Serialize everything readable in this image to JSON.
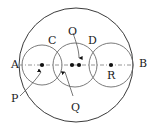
{
  "figure": {
    "type": "geometry-diagram",
    "background_color": "#ffffff",
    "stroke_color": "#3b3b3b",
    "dot_color": "#111111",
    "axis_line_style": "dash-dot",
    "labels": [
      {
        "id": "A",
        "text": "A",
        "x": 11,
        "y": 59,
        "role": "endpoint-left"
      },
      {
        "id": "B",
        "text": "B",
        "x": 139,
        "y": 58,
        "role": "endpoint-right"
      },
      {
        "id": "C",
        "text": "C",
        "x": 48,
        "y": 35,
        "role": "point-top-left"
      },
      {
        "id": "O",
        "text": "O",
        "x": 68,
        "y": 26,
        "role": "center-big-circle"
      },
      {
        "id": "D",
        "text": "D",
        "x": 88,
        "y": 35,
        "role": "point-top-right"
      },
      {
        "id": "P",
        "text": "P",
        "x": 11,
        "y": 93,
        "role": "center-left-circle"
      },
      {
        "id": "Q",
        "text": "Q",
        "x": 71,
        "y": 102,
        "role": "center-middle-circle"
      },
      {
        "id": "R",
        "text": "R",
        "x": 107,
        "y": 70,
        "role": "center-right-circle"
      }
    ],
    "circles": [
      {
        "id": "big-circle",
        "cx": 76,
        "cy": 65,
        "r": 57,
        "name": "outer-circle"
      },
      {
        "id": "left-circle",
        "cx": 42,
        "cy": 65,
        "r": 20,
        "name": "circle-p"
      },
      {
        "id": "middle-circle",
        "cx": 75,
        "cy": 65,
        "r": 22,
        "name": "circle-q"
      },
      {
        "id": "right-circle",
        "cx": 111,
        "cy": 65,
        "r": 22,
        "name": "circle-r"
      }
    ],
    "dots": [
      {
        "id": "dot-p",
        "cx": 42,
        "cy": 65,
        "r": 2.1,
        "name": "center-dot-p"
      },
      {
        "id": "dot-q",
        "cx": 72,
        "cy": 65,
        "r": 2.1,
        "name": "center-dot-q"
      },
      {
        "id": "dot-o",
        "cx": 79,
        "cy": 65,
        "r": 2.1,
        "name": "center-dot-o"
      },
      {
        "id": "dot-r",
        "cx": 111,
        "cy": 65,
        "r": 2.1,
        "name": "center-dot-r"
      }
    ],
    "axis": {
      "x1": 19,
      "y1": 65,
      "x2": 134,
      "y2": 65,
      "name": "diameter-ab"
    },
    "leaders": [
      {
        "id": "leader-o",
        "from_x": 73,
        "from_y": 32,
        "to_x": 79,
        "to_y": 60,
        "arrow": "down",
        "name": "leader-line-o"
      },
      {
        "id": "leader-q",
        "from_x": 73,
        "from_y": 96,
        "to_x": 64,
        "to_y": 71,
        "arrow": "up",
        "name": "leader-line-q"
      },
      {
        "id": "leader-p",
        "from_x": 20,
        "from_y": 95,
        "to_x": 41,
        "to_y": 71,
        "arrow": "up",
        "name": "leader-line-p"
      }
    ]
  }
}
